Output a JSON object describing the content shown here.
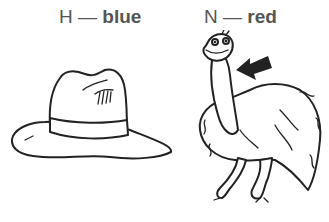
{
  "items": [
    {
      "letter": "H",
      "dash": "—",
      "color_word": "blue",
      "picture": "hat-illustration"
    },
    {
      "letter": "N",
      "dash": "—",
      "color_word": "red",
      "picture": "emu-illustration",
      "pointer": "arrow-pointing-at-neck"
    }
  ],
  "colors": {
    "text": "#555555",
    "line_art": "#222222",
    "background": "#ffffff"
  }
}
